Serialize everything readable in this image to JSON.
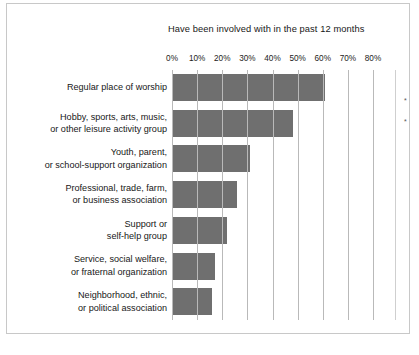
{
  "chart_data": {
    "type": "bar",
    "orientation": "horizontal",
    "title": "Have been involved with in the past 12 months",
    "xlabel": "",
    "ylabel": "",
    "xlim": [
      0,
      80
    ],
    "grid": true,
    "legend": null,
    "tick_labels": [
      "0%",
      "10%",
      "20%",
      "30%",
      "40%",
      "50%",
      "60%",
      "70%",
      "80%"
    ],
    "tick_values": [
      0,
      10,
      20,
      30,
      40,
      50,
      60,
      70,
      80
    ],
    "categories": [
      "Regular place of worship",
      "Hobby, sports, arts, music, or other leisure activity group",
      "Youth, parent, or school-support organization",
      "Professional, trade, farm, or business association",
      "Support or self-help group",
      "Service, social welfare, or fraternal organization",
      "Neighborhood, ethnic, or political association"
    ],
    "values": [
      61,
      48,
      31,
      26,
      22,
      17,
      16
    ],
    "bar_color": "#6f6f6f",
    "annotations": [
      "*",
      "*"
    ]
  },
  "rows": [
    {
      "line1": "Regular place of worship",
      "line2": "",
      "value": 61
    },
    {
      "line1": "Hobby, sports, arts, music,",
      "line2": "or other leisure activity group",
      "value": 48
    },
    {
      "line1": "Youth, parent,",
      "line2": "or school-support organization",
      "value": 31
    },
    {
      "line1": "Professional, trade, farm,",
      "line2": "or business association",
      "value": 26
    },
    {
      "line1": "Support or",
      "line2": "self-help group",
      "value": 22
    },
    {
      "line1": "Service, social welfare,",
      "line2": "or fraternal organization",
      "value": 17
    },
    {
      "line1": "Neighborhood, ethnic,",
      "line2": "or political association",
      "value": 16
    }
  ],
  "ticks": [
    {
      "label": "0%"
    },
    {
      "label": "10%"
    },
    {
      "label": "20%"
    },
    {
      "label": "30%"
    },
    {
      "label": "40%"
    },
    {
      "label": "50%"
    },
    {
      "label": "60%"
    },
    {
      "label": "70%"
    },
    {
      "label": "80%"
    }
  ],
  "footnotes": [
    {
      "mark": "*"
    },
    {
      "mark": "*"
    }
  ]
}
